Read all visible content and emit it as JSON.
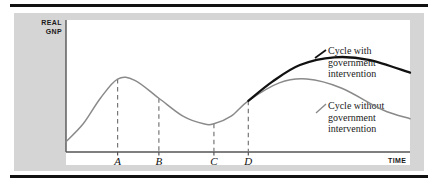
{
  "figure": {
    "y_axis_title": "REAL\nGNP",
    "x_axis_title": "TIME",
    "tick_labels": [
      "A",
      "B",
      "C",
      "D"
    ],
    "legend": {
      "with_intervention": "Cycle with\ngovernment\nintervention",
      "without_intervention": "Cycle without\ngovernment\nintervention"
    },
    "colors": {
      "panel_background": "#d5d5d5",
      "plot_background": "#ffffff",
      "rule": "#111111",
      "curve_without_intervention": "#8a8a8a",
      "curve_with_intervention": "#111111",
      "axis": "#555555",
      "dashed_guide": "#777777"
    }
  },
  "chart_data": {
    "type": "line",
    "title": "",
    "xlabel": "TIME",
    "ylabel": "REAL GNP",
    "grid": false,
    "legend_position": "right",
    "xlim": [
      0,
      100
    ],
    "ylim": [
      0,
      100
    ],
    "xticks": [
      15,
      27,
      43,
      53
    ],
    "xticklabels": [
      "A",
      "B",
      "C",
      "D"
    ],
    "yticks": [],
    "yticklabels": [],
    "annotations": [
      {
        "text": "Cycle with government intervention",
        "x": 80,
        "y": 78
      },
      {
        "text": "Cycle without government intervention",
        "x": 80,
        "y": 40
      }
    ],
    "series": [
      {
        "name": "Cycle without government intervention",
        "color": "#8a8a8a",
        "style": "solid",
        "points": [
          {
            "x": 0,
            "y": 8
          },
          {
            "x": 5,
            "y": 22
          },
          {
            "x": 10,
            "y": 42
          },
          {
            "x": 15,
            "y": 57
          },
          {
            "x": 20,
            "y": 56
          },
          {
            "x": 27,
            "y": 42
          },
          {
            "x": 34,
            "y": 28
          },
          {
            "x": 40,
            "y": 22
          },
          {
            "x": 43,
            "y": 22
          },
          {
            "x": 48,
            "y": 28
          },
          {
            "x": 53,
            "y": 40
          },
          {
            "x": 62,
            "y": 54
          },
          {
            "x": 70,
            "y": 57
          },
          {
            "x": 80,
            "y": 50
          },
          {
            "x": 92,
            "y": 33
          },
          {
            "x": 100,
            "y": 26
          }
        ]
      },
      {
        "name": "Cycle with government intervention",
        "color": "#111111",
        "style": "solid",
        "points": [
          {
            "x": 53,
            "y": 40
          },
          {
            "x": 60,
            "y": 55
          },
          {
            "x": 68,
            "y": 68
          },
          {
            "x": 78,
            "y": 74
          },
          {
            "x": 88,
            "y": 72
          },
          {
            "x": 100,
            "y": 62
          }
        ]
      }
    ],
    "guides": [
      {
        "label": "A",
        "x": 15,
        "y_top": 57
      },
      {
        "label": "B",
        "x": 27,
        "y_top": 42
      },
      {
        "label": "C",
        "x": 43,
        "y_top": 22
      },
      {
        "label": "D",
        "x": 53,
        "y_top": 40
      }
    ]
  }
}
